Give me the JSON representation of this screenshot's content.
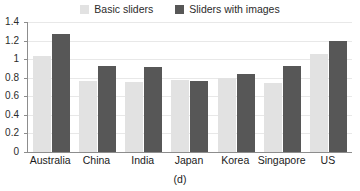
{
  "caption": "(d)",
  "legend": {
    "position": "top-center",
    "entries": [
      {
        "label": "Basic sliders",
        "swatch_name": "legend-swatch-basic-sliders",
        "color": "#e2e2e2"
      },
      {
        "label": "Sliders with images",
        "swatch_name": "legend-swatch-sliders-with-images",
        "color": "#575757"
      }
    ]
  },
  "chart_data": {
    "type": "bar",
    "title": "",
    "subtitle": "",
    "xlabel": "",
    "ylabel": "",
    "categories": [
      "Australia",
      "China",
      "India",
      "Japan",
      "Korea",
      "Singapore",
      "US"
    ],
    "series": [
      {
        "name": "Basic sliders",
        "color": "#e2e2e2",
        "values": [
          1.03,
          0.76,
          0.755,
          0.78,
          0.8,
          0.745,
          1.06
        ]
      },
      {
        "name": "Sliders with images",
        "color": "#575757",
        "values": [
          1.27,
          0.93,
          0.92,
          0.77,
          0.84,
          0.93,
          1.2
        ]
      }
    ],
    "ylim": [
      0,
      1.4
    ],
    "yticks": [
      0,
      0.2,
      0.4,
      0.6,
      0.8,
      1,
      1.2,
      1.4
    ],
    "ytick_labels": [
      "0",
      "0.2",
      "0.4",
      "0.6",
      "0.8",
      "1",
      "1.2",
      "1.4"
    ],
    "grid": true,
    "grid_axis": "y",
    "legend_position": "top-center",
    "annotations": [
      "(d)"
    ]
  }
}
